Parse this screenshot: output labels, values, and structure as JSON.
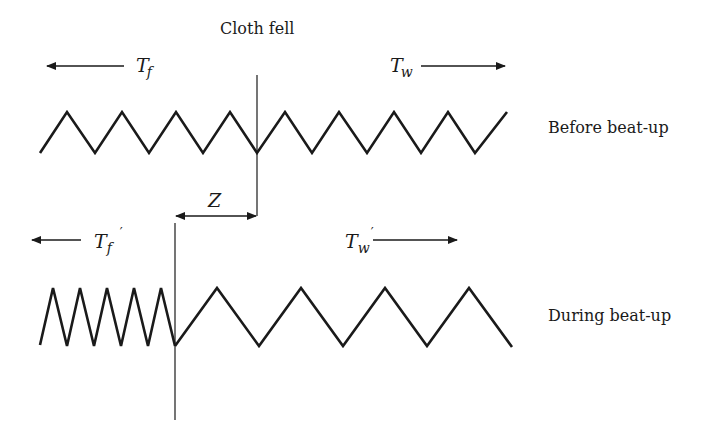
{
  "diagram": {
    "title_label": "Cloth fell",
    "rows": [
      {
        "state_label": "Before beat-up",
        "left_tension": {
          "symbol": "T",
          "subscript": "f",
          "prime": ""
        },
        "right_tension": {
          "symbol": "T",
          "subscript": "w",
          "prime": ""
        }
      },
      {
        "state_label": "During beat-up",
        "left_tension": {
          "symbol": "T",
          "subscript": "f",
          "prime": "′"
        },
        "right_tension": {
          "symbol": "T",
          "subscript": "w",
          "prime": "′"
        }
      }
    ],
    "displacement_label": "Z",
    "colors": {
      "line": "#1a1a1a",
      "background": "#ffffff"
    }
  }
}
